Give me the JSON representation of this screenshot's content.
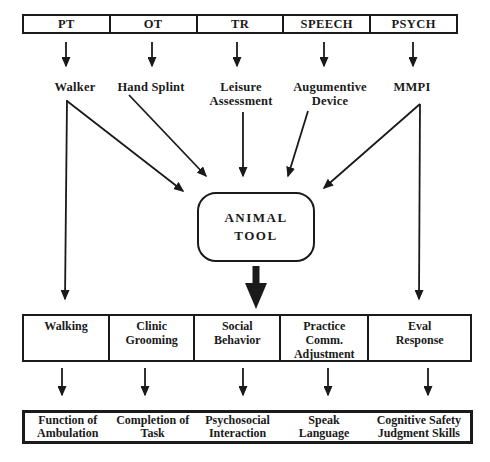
{
  "colors": {
    "ink": "#1a1a1a",
    "paper": "#ffffff"
  },
  "disciplines": [
    "PT",
    "OT",
    "TR",
    "SPEECH",
    "PSYCH"
  ],
  "interventions": [
    "Walker",
    "Hand Splint",
    "Leisure\nAssessment",
    "Augumentive\nDevice",
    "MMPI"
  ],
  "central_node": {
    "label": "ANIMAL\nTOOL"
  },
  "behaviors": [
    "Walking",
    "Clinic\nGrooming",
    "Social\nBehavior",
    "Practice\nComm.\nAdjustment",
    "Eval\nResponse"
  ],
  "outcomes": [
    "Function of\nAmbulation",
    "Completion of\nTask",
    "Psychosocial\nInteraction",
    "Speak\nLanguage",
    "Cognitive Safety\nJudgment Skills"
  ],
  "edges": [
    {
      "from": "PT",
      "to": "Walker"
    },
    {
      "from": "OT",
      "to": "Hand Splint"
    },
    {
      "from": "TR",
      "to": "Leisure Assessment"
    },
    {
      "from": "SPEECH",
      "to": "Augumentive Device"
    },
    {
      "from": "PSYCH",
      "to": "MMPI"
    },
    {
      "from": "Walker",
      "to": "ANIMAL TOOL"
    },
    {
      "from": "Hand Splint",
      "to": "ANIMAL TOOL"
    },
    {
      "from": "Leisure Assessment",
      "to": "ANIMAL TOOL"
    },
    {
      "from": "Augumentive Device",
      "to": "ANIMAL TOOL"
    },
    {
      "from": "MMPI",
      "to": "ANIMAL TOOL"
    },
    {
      "from": "Walker",
      "to": "Walking"
    },
    {
      "from": "MMPI",
      "to": "Eval Response"
    },
    {
      "from": "ANIMAL TOOL",
      "to": "behaviors-bar"
    },
    {
      "from": "Walking",
      "to": "Function of Ambulation"
    },
    {
      "from": "Clinic Grooming",
      "to": "Completion of Task"
    },
    {
      "from": "Social Behavior",
      "to": "Psychosocial Interaction"
    },
    {
      "from": "Practice Comm. Adjustment",
      "to": "Speak Language"
    },
    {
      "from": "Eval Response",
      "to": "Cognitive Safety Judgment Skills"
    }
  ]
}
